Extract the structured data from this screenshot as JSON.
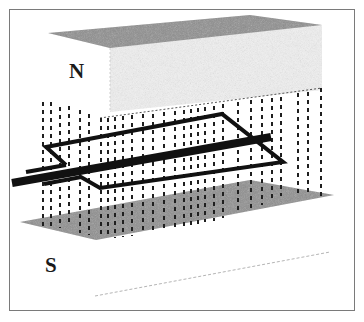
{
  "diagram": {
    "labels": {
      "north": "N",
      "south": "S"
    },
    "colors": {
      "pole_face": "#8e8e8e",
      "pole_body": "#f2f2f2",
      "field_lines": "#1f1f1f",
      "coil": "#111111",
      "axle": "#111111",
      "frame": "#7a7a7a"
    },
    "field_lines": {
      "style": "dashed",
      "direction": "vertical",
      "count_approx": 32
    }
  }
}
